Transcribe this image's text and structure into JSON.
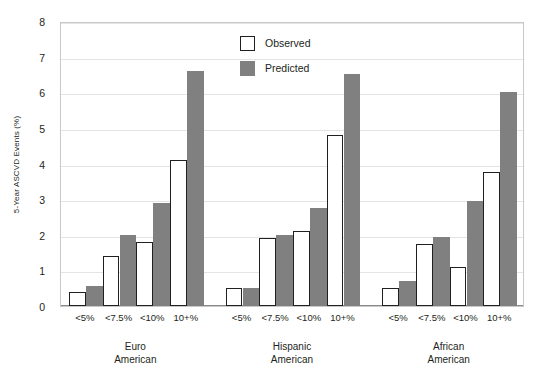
{
  "chart_data": {
    "type": "bar",
    "title": "",
    "subtitle": "",
    "xlabel": "",
    "ylabel": "5-Year ASCVD Events (%)",
    "ylim": [
      0,
      8
    ],
    "ytick_labels": [
      "8",
      "7",
      "6",
      "5",
      "4",
      "3",
      "2",
      "1",
      "0"
    ],
    "ytick_values": [
      8,
      7,
      6,
      5,
      4,
      3,
      2,
      1,
      0
    ],
    "grid": true,
    "legend_position": "inside-top-center",
    "categories": [
      "<5%",
      "<7.5%",
      "<10%",
      "10+%"
    ],
    "groups": [
      "Euro American",
      "Hispanic American",
      "African American"
    ],
    "group_labels": [
      {
        "line1": "Euro",
        "line2": "American"
      },
      {
        "line1": "Hispanic",
        "line2": "American"
      },
      {
        "line1": "African",
        "line2": "American"
      }
    ],
    "series": [
      {
        "name": "Observed",
        "color": "#ffffff",
        "edge_color": "#231f20",
        "values_by_group": {
          "Euro American": [
            0.4,
            1.4,
            1.8,
            4.1
          ],
          "Hispanic American": [
            0.5,
            1.9,
            2.1,
            4.8
          ],
          "African American": [
            0.5,
            1.75,
            1.1,
            3.75
          ]
        }
      },
      {
        "name": "Predicted",
        "color": "#808080",
        "edge_color": "#808080",
        "values_by_group": {
          "Euro American": [
            0.55,
            2.0,
            2.9,
            6.6
          ],
          "Hispanic American": [
            0.5,
            2.0,
            2.75,
            6.5
          ],
          "African American": [
            0.7,
            1.95,
            2.95,
            6.0
          ]
        }
      }
    ]
  },
  "legend": {
    "items": [
      {
        "label": "Observed",
        "style": "observed"
      },
      {
        "label": "Predicted",
        "style": "predicted"
      }
    ]
  },
  "axes": {
    "y_title": "5-Year ASCVD Events (%)"
  },
  "colors": {
    "predicted_fill": "#808080",
    "observed_fill": "#ffffff",
    "outline": "#231f20",
    "gridline": "#e4e4e4",
    "frame": "#c9c9c9"
  }
}
